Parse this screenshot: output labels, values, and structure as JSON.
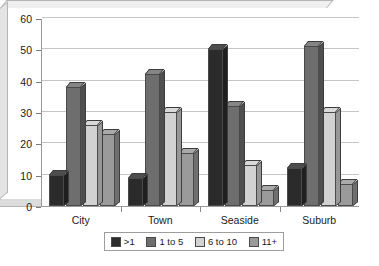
{
  "chart_data": {
    "type": "bar",
    "title": "",
    "xlabel": "",
    "ylabel": "",
    "ylim": [
      0,
      60
    ],
    "yticks": [
      0,
      10,
      20,
      30,
      40,
      50,
      60
    ],
    "grid": true,
    "legend_position": "bottom",
    "categories": [
      "City",
      "Town",
      "Seaside",
      "Suburb"
    ],
    "series": [
      {
        "name": ">1",
        "color": "#2b2b2b",
        "values": [
          10,
          9,
          50,
          12
        ]
      },
      {
        "name": "1 to 5",
        "color": "#6e6e6e",
        "values": [
          38,
          42,
          32,
          51
        ]
      },
      {
        "name": "6 to 10",
        "color": "#d2d2d2",
        "values": [
          26,
          30,
          13,
          30
        ]
      },
      {
        "name": "11+",
        "color": "#9a9a9a",
        "values": [
          23,
          17,
          5,
          7
        ]
      }
    ]
  },
  "legend": {
    "items": [
      {
        "label": ">1"
      },
      {
        "label": "1 to 5"
      },
      {
        "label": "6 to 10"
      },
      {
        "label": "11+"
      }
    ]
  },
  "axes": {
    "y_tick_labels": [
      "0",
      "10",
      "20",
      "30",
      "40",
      "50",
      "60"
    ],
    "x_tick_labels": [
      "City",
      "Town",
      "Seaside",
      "Suburb"
    ]
  }
}
